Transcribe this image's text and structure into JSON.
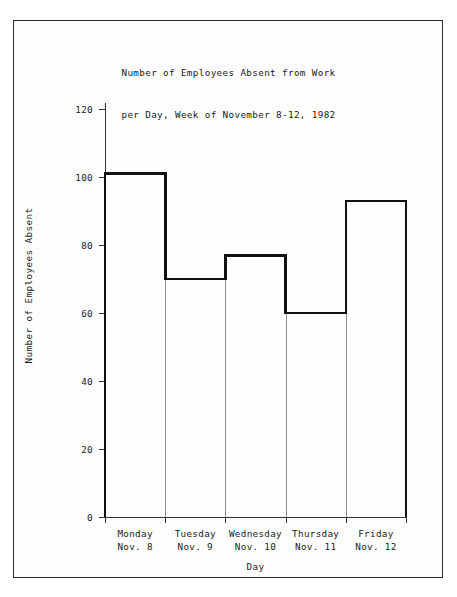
{
  "chart_data": {
    "type": "bar",
    "title": "Number of Employees Absent from Work\nper Day, Week of November 8-12, 1982",
    "title_lines": [
      "Number of Employees Absent from Work",
      "per Day, Week of November 8-12, 1982"
    ],
    "xlabel": "Day",
    "ylabel": "Number of Employees Absent",
    "categories": [
      "Monday\nNov. 8",
      "Tuesday\nNov. 9",
      "Wednesday\nNov. 10",
      "Thursday\nNov. 11",
      "Friday\nNov. 12"
    ],
    "category_parts": [
      {
        "day": "Monday",
        "date": "Nov. 8"
      },
      {
        "day": "Tuesday",
        "date": "Nov. 9"
      },
      {
        "day": "Wednesday",
        "date": "Nov. 10"
      },
      {
        "day": "Thursday",
        "date": "Nov. 11"
      },
      {
        "day": "Friday",
        "date": "Nov. 12"
      }
    ],
    "values": [
      101,
      70,
      77,
      60,
      93
    ],
    "ylim": [
      0,
      120
    ],
    "ytick_labels": [
      "0",
      "20",
      "40",
      "60",
      "80",
      "100",
      "120"
    ],
    "ytick_values": [
      0,
      20,
      40,
      60,
      80,
      100,
      120
    ],
    "grid": false,
    "legend": false,
    "style": {
      "bar_fill": "#ffffff",
      "bar_outline": "#111111",
      "separator": "#8f8f8f",
      "axis": "#333333",
      "page_border": "#2b2b2b",
      "background": "#ffffff"
    }
  }
}
